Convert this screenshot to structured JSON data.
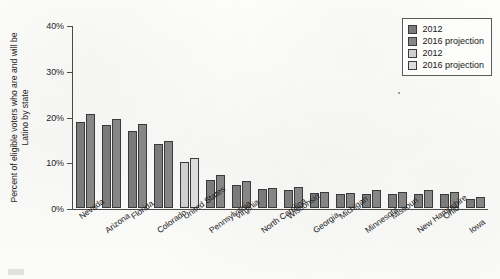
{
  "chart_data": {
    "type": "bar",
    "title": "",
    "subtitle": "",
    "xlabel": "",
    "ylabel": "Percent of eligible voters who are and will be Latino by state",
    "ylim": [
      0,
      40
    ],
    "ytick_labels": [
      "0%",
      "10%",
      "20%",
      "30%",
      "40%"
    ],
    "ytick_values": [
      0,
      10,
      20,
      30,
      40
    ],
    "grid": false,
    "legend_position": "top-right",
    "categories": [
      "Nevada",
      "Arizona",
      "Florida",
      "Colorado",
      "United States",
      "Pennsylvania",
      "Virginia",
      "North Carolina",
      "Wisconsin",
      "Georgia",
      "Michigan",
      "Minnesota",
      "Missouri",
      "New Hampshire",
      "Ohio",
      "Iowa"
    ],
    "series": [
      {
        "name": "2012",
        "color": "#7b7b7b",
        "values": [
          18.8,
          18.1,
          16.9,
          14.0,
          null,
          6.2,
          5.0,
          4.1,
          4.0,
          3.3,
          3.0,
          3.1,
          3.1,
          3.1,
          3.1,
          2.0
        ]
      },
      {
        "name": "2016 projection",
        "color": "#868686",
        "values": [
          20.5,
          19.4,
          18.3,
          14.7,
          null,
          7.2,
          5.8,
          4.4,
          4.6,
          3.5,
          3.3,
          3.9,
          3.5,
          4.0,
          3.6,
          2.5
        ]
      },
      {
        "name": "2012",
        "color": "#cfcfcf",
        "values": [
          null,
          null,
          null,
          null,
          10.0,
          null,
          null,
          null,
          null,
          null,
          null,
          null,
          null,
          null,
          null,
          null
        ]
      },
      {
        "name": "2016 projection",
        "color": "#dcdcdc",
        "values": [
          null,
          null,
          null,
          null,
          10.9,
          null,
          null,
          null,
          null,
          null,
          null,
          null,
          null,
          null,
          null,
          null
        ]
      }
    ]
  },
  "legend": {
    "entries": [
      {
        "label": "2012",
        "color": "#7b7b7b"
      },
      {
        "label": "2016 projection",
        "color": "#868686"
      },
      {
        "label": "2012",
        "color": "#cfcfcf"
      },
      {
        "label": "2016 projection",
        "color": "#dcdcdc"
      }
    ]
  }
}
